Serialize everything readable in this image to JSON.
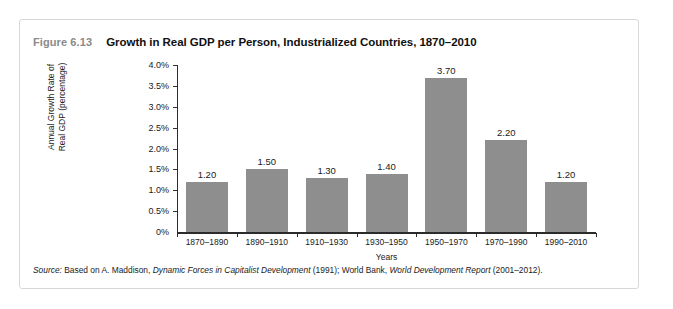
{
  "figure": {
    "number": "Figure 6.13",
    "title": "Growth in Real GDP per Person, Industrialized Countries, 1870–2010",
    "source": {
      "prefix": "Source:",
      "part1": " Based on A. Maddison, ",
      "work1": "Dynamic Forces in Capitalist Development",
      "part2": " (1991); World Bank, ",
      "work2": "World Development Report",
      "part3": " (2001–2012)."
    }
  },
  "chart_data": {
    "type": "bar",
    "title": "Growth in Real GDP per Person, Industrialized Countries, 1870–2010",
    "subtitle": "",
    "xlabel": "Years",
    "ylabel": "Annual Growth Rate of Real GDP (percentage)",
    "ylabel_line1": "Annual Growth Rate of",
    "ylabel_line2": "Real GDP (percentage)",
    "categories": [
      "1870–1890",
      "1890–1910",
      "1910–1930",
      "1930–1950",
      "1950–1970",
      "1970–1990",
      "1990–2010"
    ],
    "values": [
      1.2,
      1.5,
      1.3,
      1.4,
      3.7,
      2.2,
      1.2
    ],
    "data_labels": [
      "1.20",
      "1.50",
      "1.30",
      "1.40",
      "3.70",
      "2.20",
      "1.20"
    ],
    "ylim": [
      0,
      4.0
    ],
    "ytick_values": [
      0,
      0.5,
      1.0,
      1.5,
      2.0,
      2.5,
      3.0,
      3.5,
      4.0
    ],
    "ytick_labels": [
      "0%",
      "0.5%",
      "1.0%",
      "1.5%",
      "2.0%",
      "2.5%",
      "3.0%",
      "3.5%",
      "4.0%"
    ],
    "grid": false,
    "legend": false,
    "bar_color": "#8e8e8e",
    "axis_color": "#2b2b2b"
  }
}
